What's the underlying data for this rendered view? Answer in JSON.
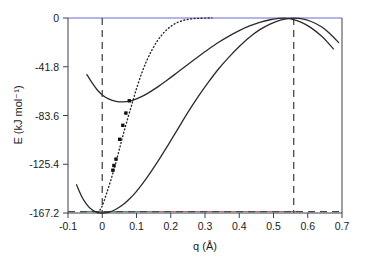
{
  "figure": {
    "kind": "potential-energy-curve-plot",
    "background_color": "#ffffff"
  },
  "chart_data": {
    "type": "line",
    "title": "",
    "subtitle": "",
    "xlabel": "q (Å)",
    "ylabel": "E (kJ mol⁻¹)",
    "xlim": [
      -0.1,
      0.7
    ],
    "ylim": [
      -167.2,
      0
    ],
    "grid": false,
    "legend": "none",
    "x_ticks": [
      -0.1,
      0,
      0.1,
      0.2,
      0.3,
      0.4,
      0.5,
      0.6,
      0.7
    ],
    "x_tick_labels": [
      "-0.1",
      "0",
      "0.1",
      "0.2",
      "0.3",
      "0.4",
      "0.5",
      "0.6",
      "0.7"
    ],
    "y_ticks": [
      0,
      -41.8,
      -83.6,
      -125.4,
      -167.2
    ],
    "y_tick_labels": [
      "0",
      "-41.8",
      "-83.6",
      "-125.4",
      "-167.2"
    ],
    "annotations": [
      {
        "name": "vertical-reference-line-left",
        "type": "vline",
        "x": 0.0,
        "style": "dashed"
      },
      {
        "name": "vertical-reference-line-right",
        "type": "vline",
        "x": 0.56,
        "style": "dashed"
      },
      {
        "name": "horizontal-baseline",
        "type": "hline",
        "y": -167.2,
        "style": "dashed"
      }
    ],
    "series": [
      {
        "name": "lower-well-curve",
        "style": "solid",
        "color": "#2b2b2b",
        "points": [
          [
            -0.075,
            -143.0
          ],
          [
            -0.06,
            -153.0
          ],
          [
            -0.045,
            -160.0
          ],
          [
            -0.03,
            -164.5
          ],
          [
            -0.015,
            -166.6
          ],
          [
            0.0,
            -167.2
          ],
          [
            0.02,
            -166.4
          ],
          [
            0.04,
            -164.0
          ],
          [
            0.06,
            -160.2
          ],
          [
            0.08,
            -155.0
          ],
          [
            0.1,
            -148.6
          ],
          [
            0.13,
            -137.0
          ],
          [
            0.16,
            -124.0
          ],
          [
            0.19,
            -110.0
          ],
          [
            0.22,
            -95.5
          ],
          [
            0.25,
            -81.0
          ],
          [
            0.28,
            -67.5
          ],
          [
            0.31,
            -55.0
          ],
          [
            0.34,
            -43.5
          ],
          [
            0.37,
            -33.5
          ],
          [
            0.4,
            -24.5
          ],
          [
            0.43,
            -16.5
          ],
          [
            0.46,
            -10.0
          ],
          [
            0.49,
            -5.2
          ],
          [
            0.52,
            -1.8
          ],
          [
            0.545,
            -0.4
          ],
          [
            0.56,
            -0.1
          ],
          [
            0.58,
            -0.6
          ],
          [
            0.61,
            -3.0
          ],
          [
            0.64,
            -7.5
          ],
          [
            0.665,
            -13.5
          ],
          [
            0.69,
            -21.0
          ]
        ]
      },
      {
        "name": "upper-well-curve",
        "style": "solid",
        "color": "#2b2b2b",
        "points": [
          [
            -0.045,
            -48.5
          ],
          [
            -0.03,
            -55.5
          ],
          [
            -0.015,
            -61.5
          ],
          [
            0.0,
            -66.0
          ],
          [
            0.02,
            -69.6
          ],
          [
            0.04,
            -71.4
          ],
          [
            0.06,
            -71.9
          ],
          [
            0.08,
            -71.2
          ],
          [
            0.1,
            -69.4
          ],
          [
            0.13,
            -65.0
          ],
          [
            0.16,
            -59.5
          ],
          [
            0.19,
            -53.2
          ],
          [
            0.22,
            -46.5
          ],
          [
            0.25,
            -39.8
          ],
          [
            0.28,
            -33.2
          ],
          [
            0.31,
            -26.8
          ],
          [
            0.34,
            -20.8
          ],
          [
            0.37,
            -15.5
          ],
          [
            0.4,
            -10.8
          ],
          [
            0.43,
            -6.8
          ],
          [
            0.46,
            -3.7
          ],
          [
            0.49,
            -1.5
          ],
          [
            0.515,
            -0.4
          ],
          [
            0.53,
            -0.1
          ],
          [
            0.55,
            -0.8
          ],
          [
            0.58,
            -3.6
          ],
          [
            0.61,
            -8.5
          ],
          [
            0.64,
            -15.5
          ],
          [
            0.66,
            -21.5
          ],
          [
            0.675,
            -26.5
          ]
        ]
      },
      {
        "name": "dotted-transition-curve",
        "style": "dotted",
        "color": "#2b2b2b",
        "points": [
          [
            -0.012,
            -167.2
          ],
          [
            0.0,
            -161.0
          ],
          [
            0.012,
            -151.0
          ],
          [
            0.025,
            -139.0
          ],
          [
            0.038,
            -126.0
          ],
          [
            0.05,
            -112.5
          ],
          [
            0.062,
            -99.0
          ],
          [
            0.075,
            -85.5
          ],
          [
            0.088,
            -72.5
          ],
          [
            0.1,
            -60.5
          ],
          [
            0.115,
            -47.5
          ],
          [
            0.13,
            -36.5
          ],
          [
            0.145,
            -27.5
          ],
          [
            0.16,
            -20.0
          ],
          [
            0.175,
            -14.2
          ],
          [
            0.19,
            -9.6
          ],
          [
            0.205,
            -6.2
          ],
          [
            0.22,
            -3.8
          ],
          [
            0.235,
            -2.2
          ],
          [
            0.25,
            -1.2
          ],
          [
            0.265,
            -0.6
          ],
          [
            0.28,
            -0.3
          ],
          [
            0.3,
            -0.1
          ],
          [
            0.32,
            0.0
          ]
        ]
      }
    ],
    "scatter": {
      "name": "computed-data-points",
      "marker": "square",
      "color": "#111111",
      "points": [
        [
          0.079,
          -71.0
        ],
        [
          0.069,
          -81.5
        ],
        [
          0.06,
          -92.0
        ],
        [
          0.051,
          -104.0
        ],
        [
          0.04,
          -121.0
        ],
        [
          0.034,
          -126.5
        ],
        [
          0.031,
          -130.5
        ]
      ]
    }
  }
}
